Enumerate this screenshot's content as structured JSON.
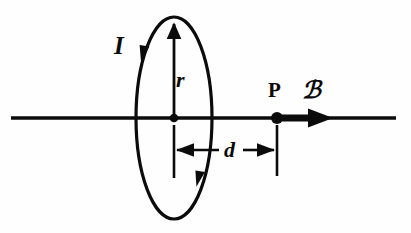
{
  "figure": {
    "background_color": "#fefefe",
    "ink_color": "#0b0b0b",
    "labels": {
      "current": "I",
      "radius": "r",
      "distance": "d",
      "point": "P",
      "field": "ℬ"
    },
    "elements": {
      "axis_line_name": "symmetry-axis",
      "loop_name": "current-loop",
      "center_dot_name": "loop-center-point",
      "field_point_name": "field-point-P",
      "field_arrow_name": "magnetic-field-arrow",
      "radius_arrow_name": "radius-arrow",
      "distance_dimension_name": "distance-dimension"
    },
    "geometry": {
      "axis_y": 118,
      "axis_x_start": 11,
      "axis_x_end": 396,
      "loop_center_x": 174,
      "loop_center_y": 118,
      "loop_rx": 38,
      "loop_ry": 101,
      "point_p_x": 277,
      "field_arrow_x_start": 278,
      "field_arrow_x_end": 332,
      "dimension_y": 150,
      "dimension_x_start": 174,
      "dimension_x_end": 277
    }
  }
}
